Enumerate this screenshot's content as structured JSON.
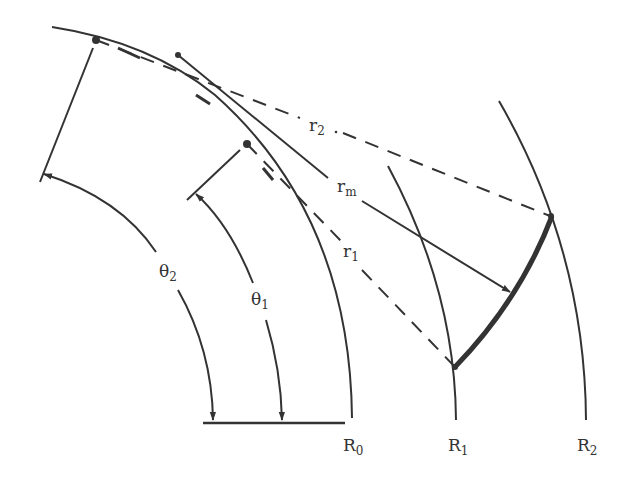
{
  "figure": {
    "type": "geometry-diagram",
    "colors": {
      "stroke": "#333333",
      "background": "#ffffff"
    }
  },
  "labels": {
    "r2": {
      "base": "r",
      "sub": "2"
    },
    "rm": {
      "base": "r",
      "sub": "m"
    },
    "r1": {
      "base": "r",
      "sub": "1"
    },
    "theta2": {
      "base": "θ",
      "sub": "2"
    },
    "theta1": {
      "base": "θ",
      "sub": "1"
    },
    "R0": {
      "base": "R",
      "sub": "0"
    },
    "R1": {
      "base": "R",
      "sub": "1"
    },
    "R2": {
      "base": "R",
      "sub": "2"
    }
  },
  "elements": {
    "arcs": [
      "R0",
      "R1",
      "R2"
    ],
    "radii": [
      {
        "name": "r2",
        "style": "dashed"
      },
      {
        "name": "rm",
        "style": "solid-arrow"
      },
      {
        "name": "r1",
        "style": "dashed"
      }
    ],
    "angles": [
      "theta1",
      "theta2"
    ],
    "thick_curve": "boundary between R1 and R2"
  }
}
